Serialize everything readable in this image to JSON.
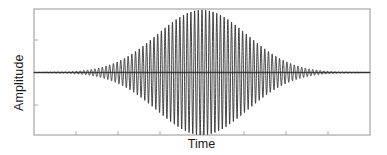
{
  "figure": {
    "width": 387,
    "height": 155,
    "background_color": "#ffffff",
    "title": ""
  },
  "axes": {
    "frame": {
      "left": 34,
      "right": 370,
      "top": 9,
      "bottom": 135
    },
    "frame_color": "#b3b3b3",
    "frame_width": 1.4,
    "baseline_y": 72.5,
    "baseline_color": "#4d4d4d",
    "x_label": "Time",
    "y_label": "Amplitude",
    "label_color": "#1a1a1a",
    "x_tick_positions": [
      76,
      118,
      160,
      202,
      244,
      286,
      328
    ],
    "y_tick_positions": [
      40,
      105
    ],
    "tick_color": "#b3b3b3",
    "tick_length": 4,
    "tick_labels_visible": false
  },
  "chart_data": {
    "type": "line",
    "title": "",
    "xlabel": "Time",
    "ylabel": "Amplitude",
    "grid": false,
    "legend": null,
    "xlim": [
      0,
      1
    ],
    "ylim": [
      -1.08,
      1.08
    ],
    "waveform": {
      "kind": "gaussian-modulated-sinusoid",
      "center_fraction": 0.5,
      "envelope_sigma_fraction": 0.134,
      "cycles_across_axis": 91,
      "peak_amplitude": 1.0,
      "line_color": "#262626",
      "line_width": 0.85,
      "samples": 5200
    },
    "series": [
      {
        "name": "wave-packet",
        "x": [
          0.0,
          0.05,
          0.1,
          0.15,
          0.2,
          0.25,
          0.3,
          0.35,
          0.4,
          0.45,
          0.5,
          0.55,
          0.6,
          0.65,
          0.7,
          0.75,
          0.8,
          0.85,
          0.9,
          0.95,
          1.0
        ],
        "envelope": [
          0.0,
          0.0001,
          0.0017,
          0.0144,
          0.0773,
          0.2645,
          0.5769,
          0.8034,
          0.9456,
          0.994,
          1.0,
          0.994,
          0.9456,
          0.8034,
          0.5769,
          0.2645,
          0.0773,
          0.0144,
          0.0017,
          0.0001,
          0.0
        ]
      }
    ]
  }
}
